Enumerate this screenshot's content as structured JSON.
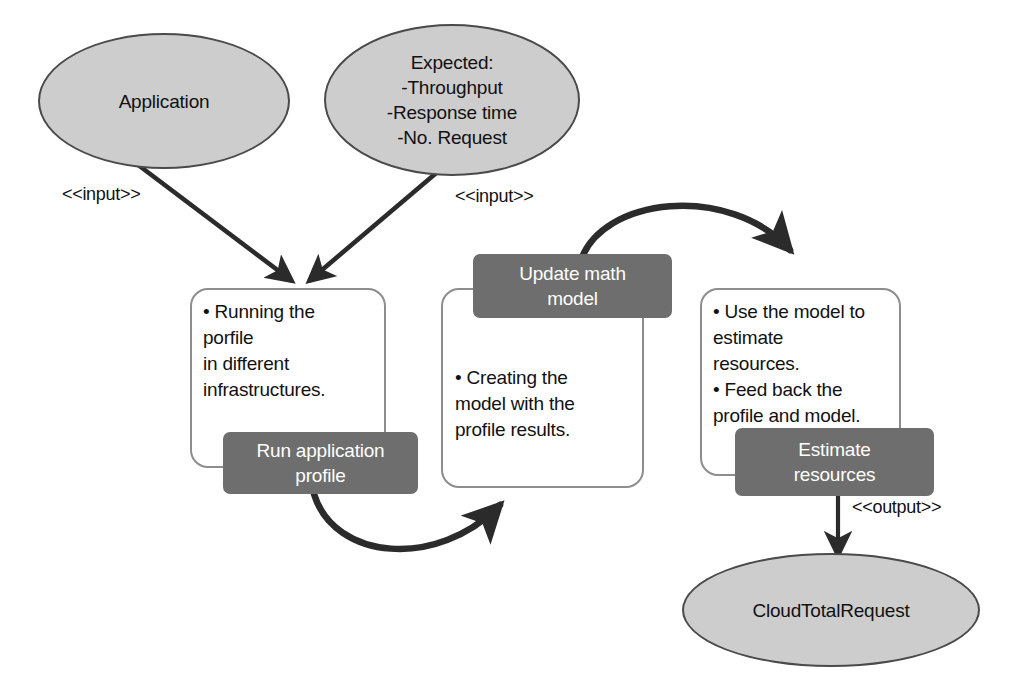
{
  "diagram": {
    "colors": {
      "ellipse_fill": "#cdcdcd",
      "ellipse_stroke": "#4a4a4a",
      "box_fill": "#ffffff",
      "box_stroke": "#8d8d8d",
      "chip_fill": "#6e6e6e",
      "chip_text": "#ffffff",
      "arrow": "#2b2b2b",
      "background": "#ffffff"
    },
    "nodes": {
      "application_ellipse": {
        "label": "Application"
      },
      "expected_ellipse": {
        "label": "Expected:\n-Throughput\n-Response time\n-No. Request"
      },
      "cloud_total_request_ellipse": {
        "label": "CloudTotalRequest"
      },
      "run_profile_box": {
        "body": "• Running the\n   porfile\n   in different\n   infrastructures.",
        "chip_label": "Run application\nprofile"
      },
      "update_model_box": {
        "body": "• Creating the\n   model with the\n   profile results.",
        "chip_label": "Update math\nmodel"
      },
      "estimate_resources_box": {
        "body": "• Use the model to\n   estimate\n   resources.\n• Feed back the\n   profile and model.",
        "chip_label": "Estimate\nresources"
      }
    },
    "edges": [
      {
        "id": "application-to-run-profile",
        "label": "<<input>>",
        "from": "application_ellipse",
        "to": "run_profile_box",
        "style": "straight-arrow"
      },
      {
        "id": "expected-to-run-profile",
        "label": "<<input>>",
        "from": "expected_ellipse",
        "to": "run_profile_box",
        "style": "straight-arrow"
      },
      {
        "id": "run-profile-to-update-model",
        "label": "",
        "from": "run_profile_box",
        "to": "update_model_box",
        "style": "curved-arrow-below"
      },
      {
        "id": "update-model-to-estimate-resources",
        "label": "",
        "from": "update_model_box",
        "to": "estimate_resources_box",
        "style": "curved-arrow-above"
      },
      {
        "id": "estimate-resources-to-cloud-total-request",
        "label": "<<output>>",
        "from": "estimate_resources_box",
        "to": "cloud_total_request_ellipse",
        "style": "straight-arrow-vertical"
      }
    ]
  }
}
